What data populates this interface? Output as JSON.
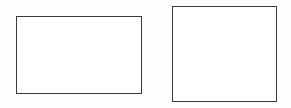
{
  "diagram": {
    "shapes": [
      {
        "id": "rect-1",
        "type": "rectangle",
        "label": "",
        "x": 16,
        "y": 16,
        "width": 126,
        "height": 78,
        "stroke": "#3a3a3a",
        "fill": "#ffffff"
      },
      {
        "id": "rect-2",
        "type": "rectangle",
        "label": "",
        "x": 172,
        "y": 6,
        "width": 105,
        "height": 96,
        "stroke": "#3a3a3a",
        "fill": "#ffffff"
      }
    ],
    "background": "#fdfdfd"
  }
}
